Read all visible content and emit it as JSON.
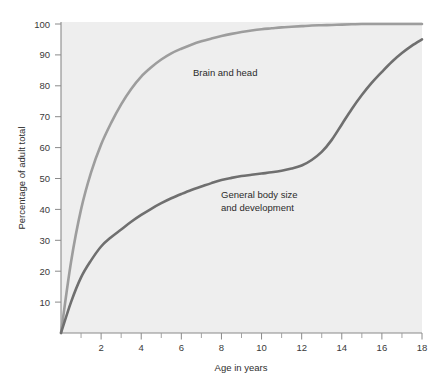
{
  "figure": {
    "background_color": "#ffffff",
    "plot_background_color": "#eeeeee",
    "axis_color": "#8a8a8a"
  },
  "chart_data": {
    "type": "line",
    "title": "",
    "xlabel": "Age in years",
    "ylabel": "Percentage of adult total",
    "xlim": [
      0,
      18
    ],
    "ylim": [
      0,
      100
    ],
    "xticks": [
      0,
      1,
      2,
      3,
      4,
      5,
      6,
      7,
      8,
      9,
      10,
      11,
      12,
      13,
      14,
      15,
      16,
      17,
      18
    ],
    "xtick_labels": [
      "",
      "",
      "2",
      "",
      "4",
      "",
      "6",
      "",
      "8",
      "",
      "10",
      "",
      "12",
      "",
      "14",
      "",
      "16",
      "",
      "18"
    ],
    "yticks": [
      10,
      20,
      30,
      40,
      50,
      60,
      70,
      80,
      90,
      100
    ],
    "ytick_labels": [
      "10",
      "20",
      "30",
      "40",
      "50",
      "60",
      "70",
      "80",
      "90",
      "100"
    ],
    "grid": false,
    "legend": "inline-annotations",
    "x": [
      0,
      0.5,
      1,
      1.5,
      2,
      2.5,
      3,
      3.5,
      4,
      4.5,
      5,
      5.5,
      6,
      6.5,
      7,
      7.5,
      8,
      8.5,
      9,
      9.5,
      10,
      10.5,
      11,
      11.5,
      12,
      12.5,
      13,
      13.5,
      14,
      14.5,
      15,
      15.5,
      16,
      16.5,
      17,
      17.5,
      18
    ],
    "series": [
      {
        "name": "Brain and head",
        "color": "#9d9d9d",
        "label_text": "Brain and head",
        "label_x": 6.8,
        "label_y": 85,
        "values": [
          0,
          23,
          40,
          52,
          61,
          68,
          74,
          79,
          83,
          86,
          88.5,
          90.5,
          92,
          93.3,
          94.4,
          95.3,
          96.1,
          96.8,
          97.4,
          97.9,
          98.3,
          98.6,
          98.9,
          99.1,
          99.3,
          99.5,
          99.6,
          99.7,
          99.8,
          99.9,
          100,
          100,
          100,
          100,
          100,
          100,
          100
        ]
      },
      {
        "name": "General body size and development",
        "color": "#6f6f6f",
        "label_text_line1": "General body size",
        "label_text_line2": "and development",
        "label_x": 8.4,
        "label_y": 44,
        "values": [
          0,
          10,
          18,
          23.5,
          28,
          31,
          33.5,
          36,
          38.2,
          40.2,
          42,
          43.6,
          45,
          46.3,
          47.4,
          48.5,
          49.5,
          50.2,
          50.8,
          51.2,
          51.6,
          52,
          52.5,
          53.2,
          54.2,
          56,
          58.6,
          62.5,
          67.5,
          72.5,
          77,
          81,
          84.5,
          87.8,
          90.6,
          93,
          95
        ]
      }
    ]
  },
  "labels": {
    "y_axis_title": "Percentage of adult total",
    "x_axis_title": "Age in years"
  }
}
